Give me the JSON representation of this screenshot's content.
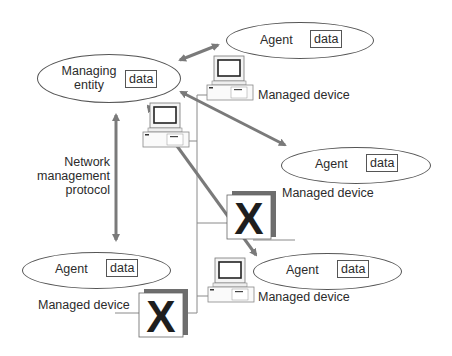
{
  "managing_entity": {
    "label_line1": "Managing",
    "label_line2": "entity",
    "data_label": "data"
  },
  "protocol_label": {
    "line1": "Network",
    "line2": "management",
    "line3": "protocol"
  },
  "agents": [
    {
      "label": "Agent",
      "data_label": "data",
      "device_label": "Managed device",
      "device_type": "computer"
    },
    {
      "label": "Agent",
      "data_label": "data",
      "device_label": "Managed device",
      "device_type": "x-device"
    },
    {
      "label": "Agent",
      "data_label": "data",
      "device_label": "Managed device",
      "device_type": "computer"
    },
    {
      "label": "Agent",
      "data_label": "data",
      "device_label": "Managed device",
      "device_type": "x-device"
    }
  ],
  "x_glyph": "X",
  "colors": {
    "arrow": "#7a7a7a",
    "outline": "#555555",
    "network_line": "#8a8a8a",
    "text": "#2b2b2b"
  }
}
